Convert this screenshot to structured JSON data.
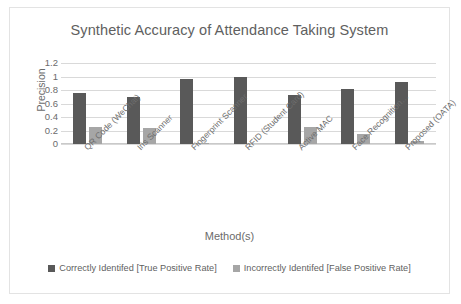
{
  "chart_data": {
    "type": "bar",
    "title": "Synthetic Accuracy of Attendance Taking System",
    "xlabel": "Method(s)",
    "ylabel": "Precision",
    "ylim": [
      0,
      1.2
    ],
    "yticks": [
      "0",
      "0.2",
      "0.4",
      "0.6",
      "0.8",
      "1",
      "1.2"
    ],
    "ytick_values": [
      0,
      0.2,
      0.4,
      0.6,
      0.8,
      1,
      1.2
    ],
    "grid": true,
    "legend_position": "bottom",
    "categories": [
      "QR Code (WeChat)",
      "Iris Scanner",
      "Fingerprint Scanner",
      "RFID (Student Card)",
      "Active MAC",
      "Face Recognition…",
      "Proposed (OATA)"
    ],
    "series": [
      {
        "name": "Correctly Identifed [True Positive Rate]",
        "color": "#595959",
        "values": [
          0.75,
          0.7,
          0.97,
          0.99,
          0.73,
          0.81,
          0.92
        ]
      },
      {
        "name": "Incorrectly Identifed [False Positive Rate]",
        "color": "#a6a6a6",
        "values": [
          0.25,
          0.23,
          0.02,
          0.0,
          0.25,
          0.15,
          0.04
        ]
      }
    ]
  },
  "colors": {
    "series_tpr": "#595959",
    "series_fpr": "#a6a6a6",
    "gridline": "#d9d9d9",
    "frame_border": "#e3e3e3",
    "text": "#6b6b6b",
    "background": "#ffffff"
  }
}
